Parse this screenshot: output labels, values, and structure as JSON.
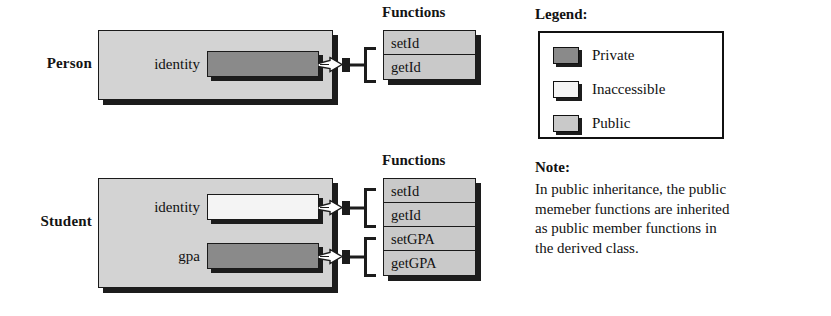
{
  "diagram": {
    "title_implicit": "Public inheritance member access diagram",
    "classes": [
      {
        "name": "Person",
        "functions_heading": "Functions",
        "members": [
          {
            "label": "identity",
            "access": "private"
          }
        ],
        "functions": [
          {
            "label": "setId",
            "access": "public"
          },
          {
            "label": "getId",
            "access": "public"
          }
        ]
      },
      {
        "name": "Student",
        "functions_heading": "Functions",
        "members": [
          {
            "label": "identity",
            "access": "inaccessible"
          },
          {
            "label": "gpa",
            "access": "private"
          }
        ],
        "functions": [
          {
            "label": "setId",
            "access": "public"
          },
          {
            "label": "getId",
            "access": "public"
          },
          {
            "label": "setGPA",
            "access": "public"
          },
          {
            "label": "getGPA",
            "access": "public"
          }
        ]
      }
    ]
  },
  "legend": {
    "title": "Legend:",
    "items": [
      {
        "label": "Private",
        "access": "private",
        "color": "#8a8a8a"
      },
      {
        "label": "Inaccessible",
        "access": "inaccessible",
        "color": "#f4f4f4"
      },
      {
        "label": "Public",
        "access": "public",
        "color": "#c9c9c9"
      }
    ]
  },
  "note": {
    "title": "Note:",
    "lines": [
      "In public inheritance, the public",
      "memeber functions are inherited",
      "as public member functions in",
      "the derived class."
    ],
    "text": "In public inheritance, the public memeber functions are inherited as public member functions in the derived class."
  },
  "colors": {
    "private": "#8a8a8a",
    "inaccessible": "#f4f4f4",
    "public": "#c9c9c9",
    "class_box": "#d3d3d3",
    "outline": "#1a1a1a",
    "shadow": "#1c1c1c",
    "background": "#ffffff"
  }
}
